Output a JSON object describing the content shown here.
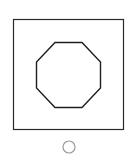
{
  "canvas": {
    "width": 131,
    "height": 166,
    "background": "#ffffff"
  },
  "frame": {
    "shape": "square",
    "stroke": "#2a2a2a"
  },
  "figure": {
    "shape": "octagon",
    "stroke": "#1e1e1e"
  },
  "option": {
    "shape": "radio-circle",
    "state": "unselected",
    "stroke": "#9a9a9a"
  }
}
